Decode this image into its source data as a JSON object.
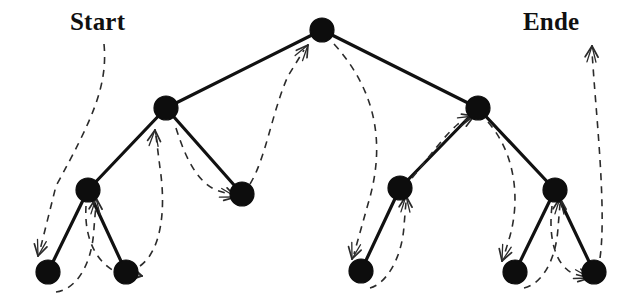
{
  "diagram": {
    "kind": "binary-tree-traversal",
    "title_visible": false,
    "colors": {
      "node_fill": "#0d0d0d",
      "edge": "#111111",
      "traversal_path": "#2b2b2b",
      "background": "#ffffff",
      "text": "#101010"
    },
    "labels": {
      "start": "Start",
      "end": "Ende"
    },
    "node_radius": 11,
    "leaf_radius": 11,
    "edge_width": 3.2,
    "path_width": 1.6,
    "path_dash": "7,6",
    "nodes": [
      {
        "id": "root",
        "x": 322,
        "y": 30,
        "r": 12,
        "level": 0
      },
      {
        "id": "L",
        "x": 166,
        "y": 108,
        "r": 12,
        "level": 1
      },
      {
        "id": "R",
        "x": 478,
        "y": 108,
        "r": 12,
        "level": 1
      },
      {
        "id": "LL",
        "x": 88,
        "y": 190,
        "r": 12,
        "level": 2
      },
      {
        "id": "LR",
        "x": 242,
        "y": 194,
        "r": 12,
        "level": 2
      },
      {
        "id": "RL",
        "x": 400,
        "y": 188,
        "r": 12,
        "level": 2
      },
      {
        "id": "RR",
        "x": 555,
        "y": 190,
        "r": 12,
        "level": 2
      },
      {
        "id": "LLL",
        "x": 48,
        "y": 272,
        "r": 12,
        "level": 3
      },
      {
        "id": "LLR",
        "x": 126,
        "y": 272,
        "r": 12,
        "level": 3
      },
      {
        "id": "RLL",
        "x": 361,
        "y": 271,
        "r": 12,
        "level": 3
      },
      {
        "id": "RRL",
        "x": 515,
        "y": 272,
        "r": 12,
        "level": 3
      },
      {
        "id": "RRR",
        "x": 594,
        "y": 272,
        "r": 12,
        "level": 3
      }
    ],
    "edges": [
      {
        "from": "root",
        "to": "L"
      },
      {
        "from": "root",
        "to": "R"
      },
      {
        "from": "L",
        "to": "LL"
      },
      {
        "from": "L",
        "to": "LR"
      },
      {
        "from": "R",
        "to": "RL"
      },
      {
        "from": "R",
        "to": "RR"
      },
      {
        "from": "LL",
        "to": "LLL"
      },
      {
        "from": "LL",
        "to": "LLR"
      },
      {
        "from": "RL",
        "to": "RLL"
      },
      {
        "from": "RR",
        "to": "RRL"
      },
      {
        "from": "RR",
        "to": "RRR"
      }
    ],
    "traversal_segments": [
      {
        "id": "seg-start-to-lll",
        "d": "M 104,44 C 108,86 92,120 56,186 L 40,250",
        "arrow_at": "end",
        "arrow_x": 38,
        "arrow_y": 256,
        "arrow_angle": 104
      },
      {
        "id": "seg-lll-to-ll",
        "d": "M 56,292 C 74,290 92,268 94,228 L 96,204",
        "arrow_at": "end",
        "arrow_x": 96,
        "arrow_y": 198,
        "arrow_angle": -88
      },
      {
        "id": "seg-ll-to-llr",
        "d": "M 86,206 C 84,238 96,262 116,272 L 138,275",
        "arrow_at": "end",
        "arrow_x": 142,
        "arrow_y": 276,
        "arrow_angle": 12
      },
      {
        "id": "seg-llr-to-l",
        "d": "M 140,266 C 162,250 166,208 160,168 L 156,136",
        "arrow_at": "end",
        "arrow_x": 155,
        "arrow_y": 130,
        "arrow_angle": -85
      },
      {
        "id": "seg-l-to-lr",
        "d": "M 176,128 C 186,160 198,182 216,190 L 232,195",
        "arrow_at": "end",
        "arrow_x": 236,
        "arrow_y": 197,
        "arrow_angle": 15
      },
      {
        "id": "seg-lr-to-root",
        "d": "M 250,184 C 266,158 272,112 288,76 L 304,50",
        "arrow_at": "end",
        "arrow_x": 308,
        "arrow_y": 45,
        "arrow_angle": -55
      },
      {
        "id": "seg-root-to-rll",
        "d": "M 334,44 C 372,86 388,138 368,204 L 354,254",
        "arrow_at": "end",
        "arrow_x": 352,
        "arrow_y": 259,
        "arrow_angle": 105
      },
      {
        "id": "seg-rll-to-rl",
        "d": "M 370,288 C 386,284 402,258 404,226 L 406,202",
        "arrow_at": "end",
        "arrow_x": 406,
        "arrow_y": 196,
        "arrow_angle": -88
      },
      {
        "id": "seg-rl-to-r",
        "d": "M 412,178 C 430,156 444,136 458,124 L 470,118",
        "arrow_at": "end",
        "arrow_x": 474,
        "arrow_y": 116,
        "arrow_angle": -22
      },
      {
        "id": "seg-r-to-rrl",
        "d": "M 488,122 C 516,154 520,200 510,236 L 504,256",
        "arrow_at": "end",
        "arrow_x": 502,
        "arrow_y": 261,
        "arrow_angle": 108
      },
      {
        "id": "seg-rrl-to-rr",
        "d": "M 524,288 C 542,284 556,260 558,228 L 560,204",
        "arrow_at": "end",
        "arrow_x": 560,
        "arrow_y": 198,
        "arrow_angle": -88
      },
      {
        "id": "seg-rr-to-rrr",
        "d": "M 552,206 C 548,240 556,266 574,274 L 586,277",
        "arrow_at": "end",
        "arrow_x": 590,
        "arrow_y": 278,
        "arrow_angle": 14
      },
      {
        "id": "seg-rrr-to-end",
        "d": "M 600,258 C 606,216 598,132 594,80 L 592,52",
        "arrow_at": "end",
        "arrow_x": 592,
        "arrow_y": 46,
        "arrow_angle": -88
      }
    ],
    "traversal_order": [
      "LLL",
      "LL",
      "LLR",
      "L",
      "LR",
      "root",
      "RLL",
      "RL",
      "R",
      "RRL",
      "RR",
      "RRR"
    ]
  }
}
